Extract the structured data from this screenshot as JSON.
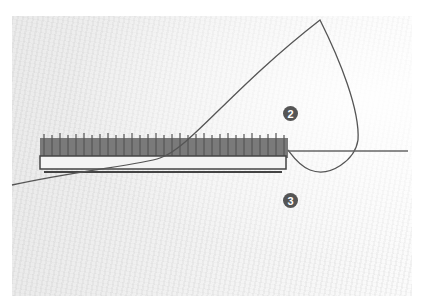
{
  "image": {
    "description": "Embroidery stitch demonstration on white fabric: a row of dense dark stitches with thread loop and needle",
    "markers": [
      {
        "label": "2"
      },
      {
        "label": "3"
      }
    ],
    "colors": {
      "fabric": "#f0f0f0",
      "stitches": "#6a6a6a",
      "thread": "#555555",
      "marker": "#555555"
    }
  }
}
